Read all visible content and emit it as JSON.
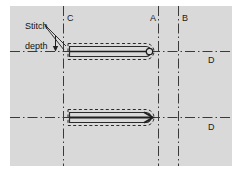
{
  "figure": {
    "type": "technical-diagram",
    "panel_color": "#d9d9d9",
    "line_color": "#3a3a3a",
    "background": "#ffffff"
  },
  "annotations": {
    "stitch_depth": {
      "line1": "Stitch",
      "line2": "depth",
      "leader_count": 2
    }
  },
  "labels": [
    {
      "id": "label-c",
      "text": "C",
      "x": 67,
      "y": 13
    },
    {
      "id": "label-a",
      "text": "A",
      "x": 150,
      "y": 13
    },
    {
      "id": "label-b",
      "text": "B",
      "x": 182,
      "y": 13
    },
    {
      "id": "label-d-upper",
      "text": "D",
      "x": 208,
      "y": 55
    },
    {
      "id": "label-d-lower",
      "text": "D",
      "x": 208,
      "y": 122
    }
  ],
  "reference_lines": {
    "vertical": [
      {
        "id": "axis-c",
        "x": 63
      },
      {
        "id": "axis-a",
        "x": 158
      },
      {
        "id": "axis-b",
        "x": 178
      }
    ],
    "horizontal": [
      {
        "id": "centerline-upper",
        "y": 51
      },
      {
        "id": "centerline-lower",
        "y": 117
      }
    ],
    "style": "dash-dot"
  },
  "stitches": [
    {
      "id": "stitch-upper",
      "tip": "loop",
      "left": 68,
      "right": 156,
      "centerline_y": 51,
      "outline": "dashed"
    },
    {
      "id": "stitch-lower",
      "tip": "arrowhead",
      "left": 68,
      "right": 156,
      "centerline_y": 117,
      "outline": "dashed"
    }
  ]
}
